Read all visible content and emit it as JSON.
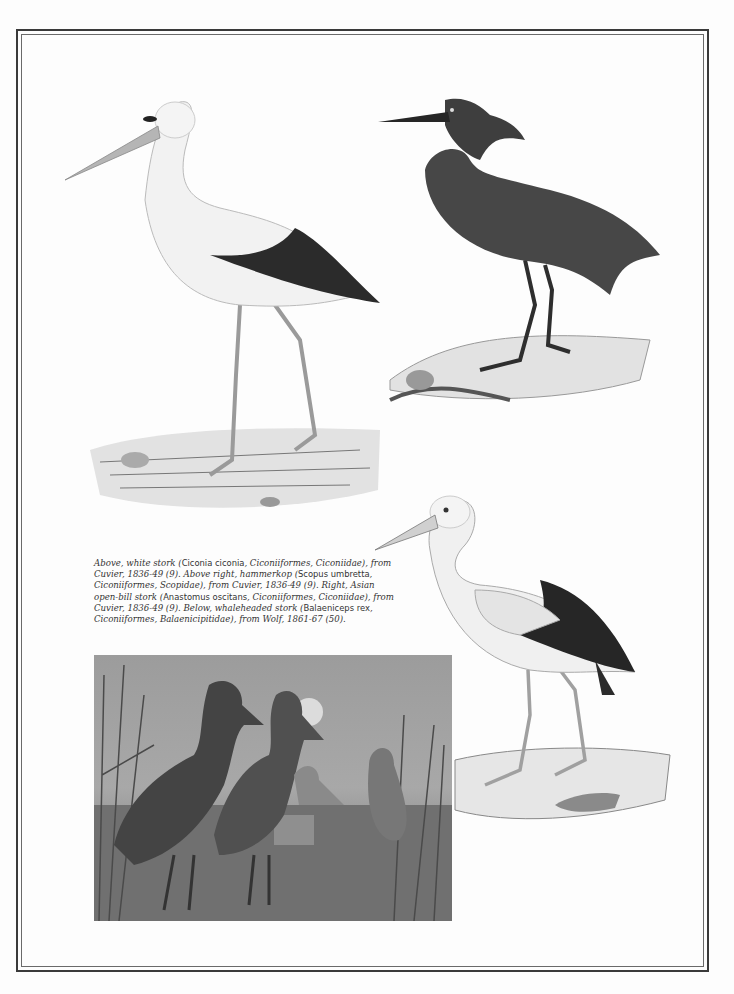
{
  "page": {
    "illustrations": [
      {
        "id": "white-stork",
        "label": "white stork",
        "style": "engraving"
      },
      {
        "id": "hammerkop",
        "label": "hammerkop",
        "style": "engraving"
      },
      {
        "id": "asian-open-bill-stork",
        "label": "Asian open-bill stork",
        "style": "engraving"
      },
      {
        "id": "whaleheaded-stork",
        "label": "whaleheaded stork",
        "style": "painting"
      }
    ],
    "caption": {
      "segments": [
        {
          "t": "Above, white stork (",
          "s": "it"
        },
        {
          "t": "Ciconia ciconia",
          "s": "rm"
        },
        {
          "t": ", Ciconiiformes, Ciconiidae), from Cuvier, 1836-49 (9). Above right, hammerkop (",
          "s": "it"
        },
        {
          "t": "Scopus umbretta",
          "s": "rm"
        },
        {
          "t": ", Ciconiiformes, Scopidae), from Cuvier, 1836-49 (9). Right, Asian open-bill stork (",
          "s": "it"
        },
        {
          "t": "Anastomus oscitans",
          "s": "rm"
        },
        {
          "t": ", Ciconiiformes, Ciconiidae), from Cuvier, 1836-49 (9). Below, whaleheaded stork (",
          "s": "it"
        },
        {
          "t": "Balaeniceps rex",
          "s": "rm"
        },
        {
          "t": ", Ciconiiformes, Balaenicipitidae), from Wolf, 1861-67 (50).",
          "s": "it"
        }
      ]
    }
  }
}
